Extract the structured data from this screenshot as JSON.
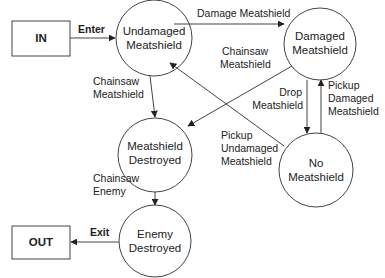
{
  "diagram": {
    "type": "state-machine",
    "terminals": {
      "in": {
        "label": "IN"
      },
      "out": {
        "label": "OUT"
      }
    },
    "states": {
      "undamaged": {
        "line1": "Undamaged",
        "line2": "Meatshield"
      },
      "damaged": {
        "line1": "Damaged",
        "line2": "Meatshield"
      },
      "destroyed": {
        "line1": "Meatshield",
        "line2": "Destroyed"
      },
      "none": {
        "line1": "No",
        "line2": "Meatshield"
      },
      "enemy": {
        "line1": "Enemy",
        "line2": "Destroyed"
      }
    },
    "transitions": {
      "enter": {
        "label": "Enter",
        "from": "IN",
        "to": "Undamaged Meatshield"
      },
      "damage": {
        "label": "Damage Meatshield",
        "from": "Undamaged Meatshield",
        "to": "Damaged Meatshield"
      },
      "chainsaw_undamaged": {
        "line1": "Chainsaw",
        "line2": "Meatshield",
        "from": "Undamaged Meatshield",
        "to": "Meatshield Destroyed"
      },
      "chainsaw_damaged": {
        "line1": "Chainsaw",
        "line2": "Meatshield",
        "from": "Damaged Meatshield",
        "to": "Meatshield Destroyed"
      },
      "drop": {
        "line1": "Drop",
        "line2": "Meatshield",
        "from": "Damaged Meatshield",
        "to": "No Meatshield"
      },
      "pickup_damaged": {
        "line1": "Pickup",
        "line2": "Damaged",
        "line3": "Meatshield",
        "from": "No Meatshield",
        "to": "Damaged Meatshield"
      },
      "pickup_undamaged": {
        "line1": "Pickup",
        "line2": "Undamaged",
        "line3": "Meatshield",
        "from": "No Meatshield",
        "to": "Undamaged Meatshield"
      },
      "chainsaw_enemy": {
        "line1": "Chainsaw",
        "line2": "Enemy",
        "from": "Meatshield Destroyed",
        "to": "Enemy Destroyed"
      },
      "exit": {
        "label": "Exit",
        "from": "Enemy Destroyed",
        "to": "OUT"
      }
    }
  }
}
